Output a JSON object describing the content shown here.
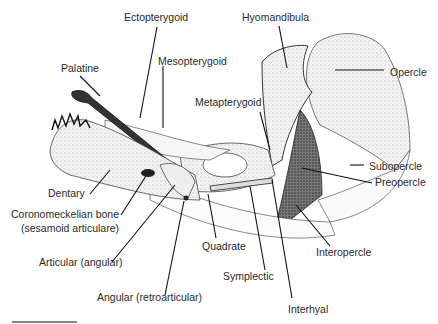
{
  "figure": {
    "type": "anatomical line drawing",
    "labels": {
      "ectopterygoid": "Ectopterygoid",
      "hyomandibula": "Hyomandibula",
      "palatine": "Palatine",
      "mesopterygoid": "Mesopterygoid",
      "opercle": "Opercle",
      "metapterygoid": "Metapterygoid",
      "subopercle": "Subopercle",
      "preopercle": "Preopercle",
      "dentary": "Dentary",
      "coronomeckelian_1": "Coronomeckelian bone",
      "coronomeckelian_2": "(sesamoid articulare)",
      "quadrate": "Quadrate",
      "interopercle": "Interopercle",
      "articular": "Articular (angular)",
      "symplectic": "Symplectic",
      "angular": "Angular (retroarticular)",
      "interhyal": "Interhyal"
    },
    "scale_bar": true
  }
}
